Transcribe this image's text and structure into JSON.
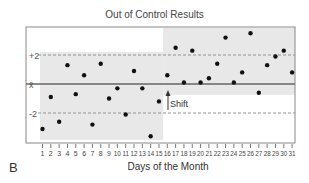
{
  "chart_data": {
    "type": "scatter",
    "title": "Out of Control Results",
    "xlabel": "Days of the Month",
    "ylabel": "",
    "panel_label": "B",
    "x": [
      1,
      2,
      3,
      4,
      5,
      6,
      7,
      8,
      9,
      10,
      11,
      12,
      13,
      14,
      15,
      16,
      17,
      18,
      19,
      20,
      21,
      22,
      23,
      24,
      25,
      26,
      27,
      28,
      29,
      30,
      31
    ],
    "values": [
      -3.1,
      -0.9,
      -2.6,
      1.3,
      -0.7,
      0.6,
      -2.8,
      1.4,
      -1.0,
      -0.3,
      -2.1,
      0.9,
      -0.3,
      -3.6,
      -1.2,
      0.6,
      2.5,
      0.1,
      2.3,
      0.1,
      0.4,
      1.4,
      3.2,
      0.1,
      0.8,
      3.5,
      -0.6,
      1.3,
      1.9,
      2.3,
      0.8
    ],
    "y_tick_labels": [
      "+2",
      "x̄",
      "-2"
    ],
    "reference_lines": [
      {
        "label": "+2",
        "value": 2,
        "style": "dashed"
      },
      {
        "label": "x̄",
        "value": 0,
        "style": "solid"
      },
      {
        "label": "-2",
        "value": -2,
        "style": "dashed"
      }
    ],
    "ylim": [
      -4,
      4
    ],
    "xlim": [
      1,
      31
    ],
    "annotations": [
      {
        "text": "Shift",
        "x": 15.5,
        "arrow": "up"
      }
    ],
    "shaded_regions": [
      {
        "x_range": [
          1,
          15.5
        ],
        "y_range": [
          -3.8,
          2.1
        ],
        "description": "before shift"
      },
      {
        "x_range": [
          15.5,
          31
        ],
        "y_range": [
          -0.8,
          3.8
        ],
        "description": "after shift"
      }
    ],
    "grid": false,
    "legend": "none"
  },
  "labels": {
    "title": "Out of Control Results",
    "xlabel": "Days of the Month",
    "panel": "B",
    "shift": "Shift",
    "plus2": "+2",
    "mean": "x̄",
    "minus2": "-2"
  }
}
